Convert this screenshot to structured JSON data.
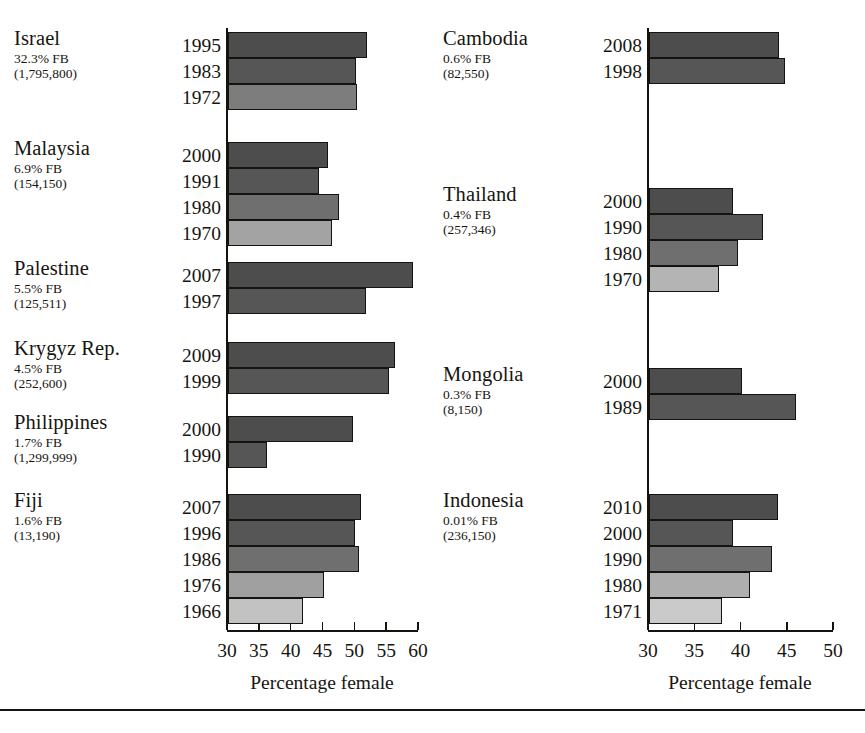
{
  "figure": {
    "panels": [
      {
        "id": "left",
        "axis": {
          "title": "Percentage female",
          "ticks": [
            30,
            35,
            40,
            45,
            50,
            55,
            60
          ],
          "tick_labels": [
            "30",
            "35",
            "40",
            "45",
            "50",
            "55",
            "60"
          ],
          "min": 30,
          "max": 60
        },
        "groups": [
          {
            "country": "Israel",
            "fb": "32.3% FB",
            "count": "(1,795,800)",
            "rows": [
              {
                "year": "1995",
                "value": 51.9,
                "shade": "#4d4d4d"
              },
              {
                "year": "1983",
                "value": 50.1,
                "shade": "#565656"
              },
              {
                "year": "1972",
                "value": 50.3,
                "shade": "#7d7d7d"
              }
            ]
          },
          {
            "country": "Malaysia",
            "fb": "6.9% FB",
            "count": "(154,150)",
            "rows": [
              {
                "year": "2000",
                "value": 45.7,
                "shade": "#4d4d4d"
              },
              {
                "year": "1991",
                "value": 44.3,
                "shade": "#565656"
              },
              {
                "year": "1980",
                "value": 47.4,
                "shade": "#6f6f6f"
              },
              {
                "year": "1970",
                "value": 46.3,
                "shade": "#a3a3a3"
              }
            ]
          },
          {
            "country": "Palestine",
            "fb": "5.5% FB",
            "count": "(125,511)",
            "rows": [
              {
                "year": "2007",
                "value": 59.0,
                "shade": "#4d4d4d"
              },
              {
                "year": "1997",
                "value": 51.7,
                "shade": "#565656"
              }
            ]
          },
          {
            "country": "Krygyz Rep.",
            "fb": "4.5% FB",
            "count": "(252,600)",
            "rows": [
              {
                "year": "2009",
                "value": 56.2,
                "shade": "#4d4d4d"
              },
              {
                "year": "1999",
                "value": 55.3,
                "shade": "#565656"
              }
            ]
          },
          {
            "country": "Philippines",
            "fb": "1.7% FB",
            "count": "(1,299,999)",
            "rows": [
              {
                "year": "2000",
                "value": 49.7,
                "shade": "#4d4d4d"
              },
              {
                "year": "1990",
                "value": 36.1,
                "shade": "#565656"
              }
            ]
          },
          {
            "country": "Fiji",
            "fb": "1.6% FB",
            "count": "(13,190)",
            "rows": [
              {
                "year": "2007",
                "value": 50.9,
                "shade": "#4d4d4d"
              },
              {
                "year": "1996",
                "value": 50.0,
                "shade": "#565656"
              },
              {
                "year": "1986",
                "value": 50.6,
                "shade": "#6f6f6f"
              },
              {
                "year": "1976",
                "value": 45.0,
                "shade": "#a0a0a0"
              },
              {
                "year": "1966",
                "value": 41.8,
                "shade": "#c2c2c2"
              }
            ]
          }
        ]
      },
      {
        "id": "right",
        "axis": {
          "title": "Percentage female",
          "ticks": [
            30,
            35,
            40,
            45,
            50
          ],
          "tick_labels": [
            "30",
            "35",
            "40",
            "45",
            "50"
          ],
          "min": 30,
          "max": 50
        },
        "groups": [
          {
            "country": "Cambodia",
            "fb": "0.6% FB",
            "count": "(82,550)",
            "rows": [
              {
                "year": "2008",
                "value": 44.0,
                "shade": "#4d4d4d"
              },
              {
                "year": "1998",
                "value": 44.7,
                "shade": "#565656"
              }
            ]
          },
          {
            "country": "Thailand",
            "fb": "0.4% FB",
            "count": "(257,346)",
            "rows": [
              {
                "year": "2000",
                "value": 39.1,
                "shade": "#4d4d4d"
              },
              {
                "year": "1990",
                "value": 42.3,
                "shade": "#565656"
              },
              {
                "year": "1980",
                "value": 39.6,
                "shade": "#6f6f6f"
              },
              {
                "year": "1970",
                "value": 37.6,
                "shade": "#b4b4b4"
              }
            ]
          },
          {
            "country": "Mongolia",
            "fb": "0.3% FB",
            "count": "(8,150)",
            "rows": [
              {
                "year": "2000",
                "value": 40.0,
                "shade": "#4d4d4d"
              },
              {
                "year": "1989",
                "value": 45.9,
                "shade": "#565656"
              }
            ]
          },
          {
            "country": "Indonesia",
            "fb": "0.01% FB",
            "count": "(236,150)",
            "rows": [
              {
                "year": "2010",
                "value": 43.9,
                "shade": "#4d4d4d"
              },
              {
                "year": "2000",
                "value": 39.1,
                "shade": "#565656"
              },
              {
                "year": "1990",
                "value": 43.3,
                "shade": "#6f6f6f"
              },
              {
                "year": "1980",
                "value": 40.9,
                "shade": "#aeaeae"
              },
              {
                "year": "1971",
                "value": 37.9,
                "shade": "#cacaca"
              }
            ]
          }
        ]
      }
    ]
  },
  "chart_data": {
    "type": "bar",
    "orientation": "horizontal",
    "title": "",
    "xlabel": "Percentage female",
    "ylabel": "",
    "grid": false,
    "legend": null,
    "panels": [
      {
        "name": "left",
        "xlim": [
          30,
          60
        ],
        "xticks": [
          30,
          35,
          40,
          45,
          50,
          55,
          60
        ],
        "categories": [
          "Israel 1995",
          "Israel 1983",
          "Israel 1972",
          "Malaysia 2000",
          "Malaysia 1991",
          "Malaysia 1980",
          "Malaysia 1970",
          "Palestine 2007",
          "Palestine 1997",
          "Krygyz Rep. 2009",
          "Krygyz Rep. 1999",
          "Philippines 2000",
          "Philippines 1990",
          "Fiji 2007",
          "Fiji 1996",
          "Fiji 1986",
          "Fiji 1976",
          "Fiji 1966"
        ],
        "values": [
          51.9,
          50.1,
          50.3,
          45.7,
          44.3,
          47.4,
          46.3,
          59.0,
          51.7,
          56.2,
          55.3,
          49.7,
          36.1,
          50.9,
          50.0,
          50.6,
          45.0,
          41.8
        ],
        "annotations": [
          "Israel 32.3% FB (1,795,800)",
          "Malaysia 6.9% FB (154,150)",
          "Palestine 5.5% FB (125,511)",
          "Krygyz Rep. 4.5% FB (252,600)",
          "Philippines 1.7% FB (1,299,999)",
          "Fiji 1.6% FB (13,190)"
        ]
      },
      {
        "name": "right",
        "xlim": [
          30,
          50
        ],
        "xticks": [
          30,
          35,
          40,
          45,
          50
        ],
        "categories": [
          "Cambodia 2008",
          "Cambodia 1998",
          "Thailand 2000",
          "Thailand 1990",
          "Thailand 1980",
          "Thailand 1970",
          "Mongolia 2000",
          "Mongolia 1989",
          "Indonesia 2010",
          "Indonesia 2000",
          "Indonesia 1990",
          "Indonesia 1980",
          "Indonesia 1971"
        ],
        "values": [
          44.0,
          44.7,
          39.1,
          42.3,
          39.6,
          37.6,
          40.0,
          45.9,
          43.9,
          39.1,
          43.3,
          40.9,
          37.9
        ],
        "annotations": [
          "Cambodia 0.6% FB (82,550)",
          "Thailand 0.4% FB (257,346)",
          "Mongolia 0.3% FB (8,150)",
          "Indonesia 0.01% FB (236,150)"
        ]
      }
    ]
  }
}
